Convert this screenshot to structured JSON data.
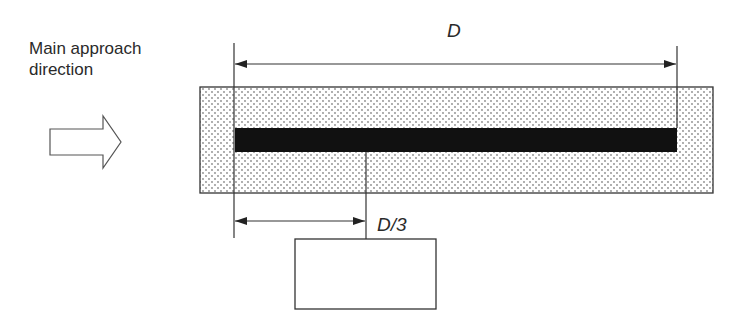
{
  "labels": {
    "approach_line1": "Main approach",
    "approach_line2": "direction",
    "dimension_full": "D",
    "dimension_third": "D/3"
  },
  "colors": {
    "stroke": "#333333",
    "bar": "#111111",
    "dot_fill": "#8a8a8a"
  },
  "elements": {
    "approach_arrow": "hollow-right-arrow",
    "stippled_zone": "dotted-rectangle",
    "solid_bar": "black-bar",
    "target_box": "empty-rectangle"
  }
}
